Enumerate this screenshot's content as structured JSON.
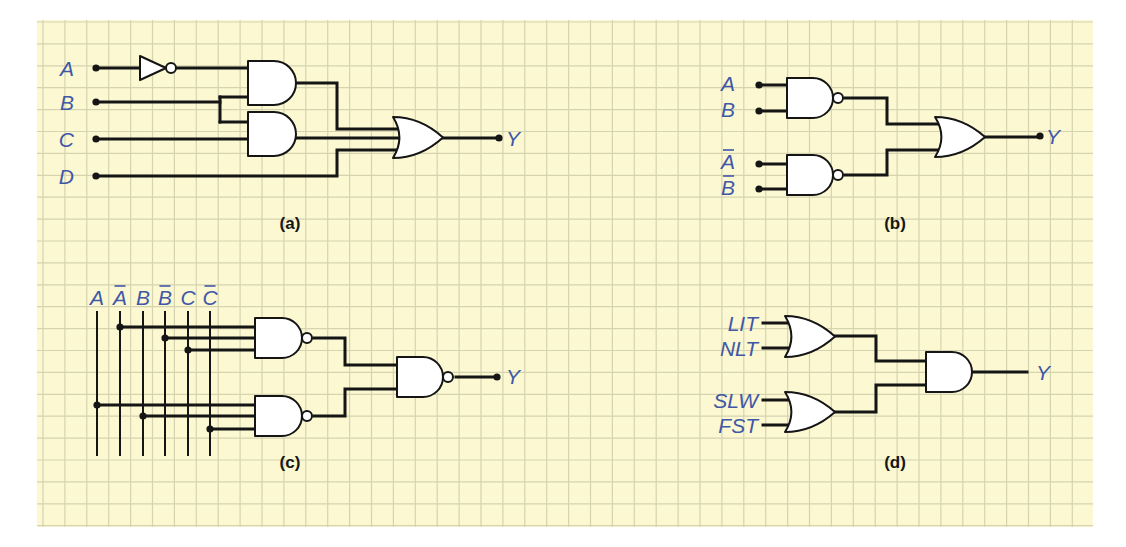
{
  "paper": {
    "x": 37,
    "y": 20,
    "width": 1056,
    "height": 507,
    "background": "#fbf8d2",
    "grid_color": "#d6d3b0",
    "grid_spacing": 21.9,
    "grid_offset_x": 6,
    "grid_offset_y": 2
  },
  "colors": {
    "signal_label": "#3f57a6",
    "wire": "#151515",
    "gate_fill": "#ffffff",
    "caption": "#161616"
  },
  "panels": [
    {
      "id": "a",
      "caption": "(a)",
      "caption_pos": [
        290,
        229
      ],
      "inputs": [
        {
          "label": "A",
          "overbar": false,
          "label_pos": [
            74,
            76
          ],
          "dot": [
            96,
            68
          ]
        },
        {
          "label": "B",
          "overbar": false,
          "label_pos": [
            74,
            110
          ],
          "dot": [
            96,
            102
          ]
        },
        {
          "label": "C",
          "overbar": false,
          "label_pos": [
            74,
            147
          ],
          "dot": [
            96,
            139
          ]
        },
        {
          "label": "D",
          "overbar": false,
          "label_pos": [
            74,
            184
          ],
          "dot": [
            96,
            176
          ]
        }
      ],
      "output": {
        "label": "Y",
        "label_pos": [
          506,
          146
        ],
        "dot": [
          499,
          138
        ]
      },
      "gates": [
        {
          "type": "NOT",
          "x": 140,
          "y": 56,
          "w": 26,
          "h": 24
        },
        {
          "type": "AND",
          "x": 248,
          "y": 61,
          "w": 48,
          "h": 44
        },
        {
          "type": "AND",
          "x": 248,
          "y": 112,
          "w": 48,
          "h": 44
        },
        {
          "type": "OR",
          "x": 393,
          "y": 117,
          "w": 50,
          "h": 41
        }
      ],
      "wires": [
        "M96,68 L140,68",
        "M170,68 L248,68",
        "M96,102 L220,102",
        "M220,97 L220,122",
        "M220,97 L248,97",
        "M220,122 L248,122",
        "M96,139 L248,139",
        "M296,83 L337,83 L337,129 L400,129",
        "M296,138 L402,138",
        "M96,176 L337,176 L337,150 L400,150",
        "M443,138 L499,138"
      ]
    },
    {
      "id": "b",
      "caption": "(b)",
      "caption_pos": [
        895,
        229
      ],
      "inputs": [
        {
          "label": "A",
          "overbar": false,
          "label_pos": [
            735,
            91
          ],
          "dot": [
            759,
            85
          ]
        },
        {
          "label": "B",
          "overbar": false,
          "label_pos": [
            735,
            117
          ],
          "dot": [
            759,
            111
          ]
        },
        {
          "label": "A",
          "overbar": true,
          "label_pos": [
            735,
            169
          ],
          "dot": [
            759,
            164
          ]
        },
        {
          "label": "B",
          "overbar": true,
          "label_pos": [
            735,
            195
          ],
          "dot": [
            759,
            189
          ]
        }
      ],
      "output": {
        "label": "Y",
        "label_pos": [
          1046,
          144
        ],
        "dot": [
          1040,
          136
        ]
      },
      "gates": [
        {
          "type": "NAND",
          "x": 787,
          "y": 78,
          "w": 46,
          "h": 40
        },
        {
          "type": "NAND",
          "x": 787,
          "y": 155,
          "w": 46,
          "h": 40
        },
        {
          "type": "OR",
          "x": 935,
          "y": 117,
          "w": 50,
          "h": 40
        }
      ],
      "wires": [
        "M759,85 L787,85",
        "M759,111 L787,111",
        "M759,164 L787,164",
        "M759,189 L787,189",
        "M845,98 L887,98 L887,124 L941,124",
        "M845,175 L887,175 L887,150 L941,150",
        "M985,137 L1040,137"
      ]
    },
    {
      "id": "c",
      "caption": "(c)",
      "caption_pos": [
        290,
        468
      ],
      "bus": {
        "top": 311,
        "bottom": 456,
        "lines": [
          {
            "label": "A",
            "overbar": false,
            "x": 97
          },
          {
            "label": "A",
            "overbar": true,
            "x": 120
          },
          {
            "label": "B",
            "overbar": false,
            "x": 143
          },
          {
            "label": "B",
            "overbar": true,
            "x": 165
          },
          {
            "label": "C",
            "overbar": false,
            "x": 188
          },
          {
            "label": "C",
            "overbar": true,
            "x": 210
          }
        ],
        "label_y": 305
      },
      "taps": [
        {
          "bus_x": 120,
          "y": 327
        },
        {
          "bus_x": 165,
          "y": 338
        },
        {
          "bus_x": 188,
          "y": 350
        },
        {
          "bus_x": 97,
          "y": 405
        },
        {
          "bus_x": 143,
          "y": 416
        },
        {
          "bus_x": 210,
          "y": 429
        }
      ],
      "output": {
        "label": "Y",
        "label_pos": [
          506,
          384
        ],
        "dot": [
          497,
          377
        ]
      },
      "gates": [
        {
          "type": "NAND",
          "x": 255,
          "y": 318,
          "w": 47,
          "h": 40
        },
        {
          "type": "NAND",
          "x": 255,
          "y": 396,
          "w": 47,
          "h": 40
        },
        {
          "type": "NAND",
          "x": 397,
          "y": 357,
          "w": 46,
          "h": 40
        }
      ],
      "wires": [
        "M120,327 L255,327",
        "M165,338 L255,338",
        "M188,350 L255,350",
        "M97,405 L255,405",
        "M143,416 L255,416",
        "M210,429 L255,429",
        "M314,338 L345,338 L345,365 L397,365",
        "M314,416 L345,416 L345,389 L397,389",
        "M456,377 L497,377"
      ]
    },
    {
      "id": "d",
      "caption": "(d)",
      "caption_pos": [
        895,
        468
      ],
      "inputs": [
        {
          "label": "LIT",
          "overbar": false,
          "label_pos": [
            758,
            331
          ],
          "end": [
            763,
            323
          ]
        },
        {
          "label": "NLT",
          "overbar": false,
          "label_pos": [
            758,
            356
          ],
          "end": [
            763,
            348
          ]
        },
        {
          "label": "SLW",
          "overbar": false,
          "label_pos": [
            758,
            408
          ],
          "end": [
            763,
            400
          ]
        },
        {
          "label": "FST",
          "overbar": false,
          "label_pos": [
            758,
            433
          ],
          "end": [
            763,
            425
          ]
        }
      ],
      "output": {
        "label": "Y",
        "label_pos": [
          1036,
          380
        ],
        "end": [
          1027,
          372
        ]
      },
      "gates": [
        {
          "type": "OR",
          "x": 785,
          "y": 316,
          "w": 50,
          "h": 41
        },
        {
          "type": "OR",
          "x": 785,
          "y": 392,
          "w": 50,
          "h": 40
        },
        {
          "type": "AND",
          "x": 926,
          "y": 352,
          "w": 46,
          "h": 40
        }
      ],
      "wires": [
        "M763,323 L791,323",
        "M763,348 L791,348",
        "M763,400 L791,400",
        "M763,425 L791,425",
        "M835,336 L876,336 L876,361 L926,361",
        "M835,412 L876,412 L876,385 L926,385",
        "M972,372 L1027,372"
      ]
    }
  ]
}
